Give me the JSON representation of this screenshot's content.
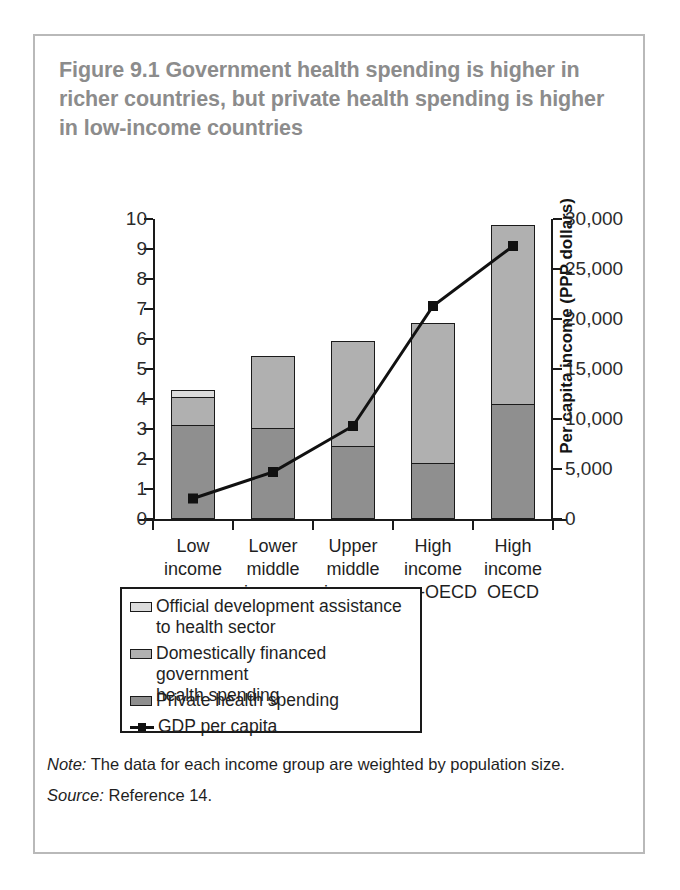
{
  "figure": {
    "title": "Figure 9.1  Government health spending is higher in richer countries, but private health spending is higher in low-income countries",
    "note_label": "Note:",
    "note_text": " The data for each income group are weighted by population size.",
    "source_label": "Source:",
    "source_text": " Reference 14."
  },
  "colors": {
    "border": "#b9b9b9",
    "title": "#8c8c8c",
    "axis": "#1a1a1a",
    "oda": "#dcdcdc",
    "government": "#b0b0b0",
    "private": "#8f8f8f",
    "line": "#111111"
  },
  "legend": {
    "items": [
      {
        "label": "Official development assistance\nto health sector",
        "swatch": "oda-swatch",
        "color": "#dcdcdc"
      },
      {
        "label": "Domestically financed government\nhealth spending",
        "swatch": "government-swatch",
        "color": "#b0b0b0"
      },
      {
        "label": "Private health spending",
        "swatch": "private-swatch",
        "color": "#8f8f8f"
      },
      {
        "label": "GDP per capita",
        "swatch": "line-marker-swatch",
        "color": "#111111"
      }
    ]
  },
  "chart_data": {
    "type": "bar",
    "title": "Figure 9.1  Government health spending is higher in richer countries, but private health spending is higher in low-income countries",
    "xlabel": "",
    "ylabel": "Share of GDP (%)",
    "y2label": "Per capita income (PPP dollars)",
    "ylim": [
      0,
      10
    ],
    "y2lim": [
      0,
      30000
    ],
    "yticks": [
      "0",
      "1",
      "2",
      "3",
      "4",
      "5",
      "6",
      "7",
      "8",
      "9",
      "10"
    ],
    "y2ticks": [
      "0",
      "5,000",
      "10,000",
      "15,000",
      "20,000",
      "25,000",
      "30,000"
    ],
    "grid": false,
    "legend_position": "below-plot",
    "stacked": true,
    "categories": [
      "Low\nincome",
      "Lower\nmiddle\nincome",
      "Upper\nmiddle\nincome",
      "High\nincome\nnon-OECD",
      "High\nincome\nOECD"
    ],
    "series": [
      {
        "name": "Private health spending",
        "axis": "left",
        "values": [
          3.1,
          3.0,
          2.4,
          1.85,
          3.8
        ]
      },
      {
        "name": "Domestically financed government health spending",
        "axis": "left",
        "values": [
          0.95,
          2.4,
          3.5,
          4.65,
          5.95
        ]
      },
      {
        "name": "Official development assistance to health sector",
        "axis": "left",
        "values": [
          0.2,
          0.0,
          0.0,
          0.0,
          0.0
        ]
      }
    ],
    "totals": [
      4.25,
      5.4,
      5.9,
      6.5,
      9.75
    ],
    "line_series": {
      "name": "GDP per capita",
      "axis": "right",
      "values": [
        2050,
        4700,
        9300,
        21300,
        27300
      ],
      "values_on_left_scale": [
        0.68,
        1.57,
        3.1,
        7.1,
        9.1
      ]
    }
  }
}
